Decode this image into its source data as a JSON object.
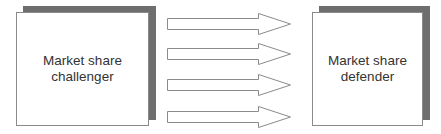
{
  "diagram": {
    "left_box": {
      "line1": "Market share",
      "line2": "challenger"
    },
    "right_box": {
      "line1": "Market share",
      "line2": "defender"
    },
    "arrows": {
      "count": 4,
      "direction": "left-to-right"
    },
    "colors": {
      "shadow": "#6e6e6e",
      "border": "#8a8a8a",
      "text": "#333333",
      "background": "#ffffff"
    }
  }
}
